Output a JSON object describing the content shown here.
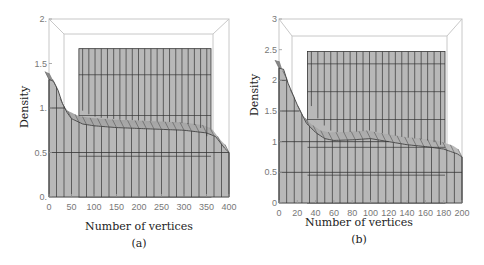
{
  "colors": {
    "surface": "#b8b8b8",
    "surface_dark": "#7a7a7a",
    "grid_line": "#333333",
    "frame": "#c8c8c8",
    "tick_text": "#777777",
    "label_text": "#222222"
  },
  "chart_data": [
    {
      "type": "area",
      "panel_label": "(a)",
      "title": "",
      "xlabel": "Number of vertices",
      "ylabel": "Density",
      "xlim": [
        0,
        400
      ],
      "ylim": [
        0,
        2
      ],
      "xticks": [
        "0",
        "50",
        "100",
        "150",
        "200",
        "250",
        "300",
        "350",
        "400"
      ],
      "yticks": [
        "0.",
        "0.5",
        "1.",
        "1.5",
        "2."
      ],
      "series": [
        {
          "name": "front density curve",
          "x": [
            0,
            10,
            20,
            30,
            40,
            50,
            75,
            100,
            150,
            200,
            250,
            300,
            350,
            370,
            390,
            400
          ],
          "values": [
            1.32,
            1.3,
            1.2,
            1.05,
            0.95,
            0.88,
            0.82,
            0.8,
            0.78,
            0.77,
            0.76,
            0.75,
            0.72,
            0.68,
            0.55,
            0.5
          ]
        }
      ],
      "back_plateau": 1.82,
      "grid": true
    },
    {
      "type": "area",
      "panel_label": "(b)",
      "title": "",
      "xlabel": "Number of vertices",
      "ylabel": "Density",
      "xlim": [
        0,
        200
      ],
      "ylim": [
        0,
        3
      ],
      "xticks": [
        "0",
        "20",
        "40",
        "60",
        "80",
        "100",
        "120",
        "140",
        "160",
        "180",
        "200"
      ],
      "yticks": [
        "0",
        "0.5",
        "1",
        "1.5",
        "2",
        "2.5",
        "3"
      ],
      "series": [
        {
          "name": "front density curve",
          "x": [
            0,
            5,
            10,
            20,
            30,
            40,
            50,
            60,
            80,
            100,
            120,
            140,
            160,
            180,
            195,
            200
          ],
          "values": [
            2.2,
            2.18,
            1.95,
            1.6,
            1.3,
            1.15,
            1.05,
            1.02,
            1.03,
            1.05,
            1.0,
            0.95,
            0.92,
            0.88,
            0.8,
            0.75
          ]
        }
      ],
      "back_plateau": 2.72,
      "grid": true
    }
  ]
}
